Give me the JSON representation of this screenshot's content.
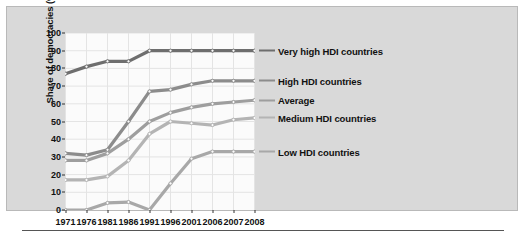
{
  "chart_data": {
    "type": "line",
    "title": "",
    "xlabel": "",
    "ylabel": "Share of democracies (%)",
    "categories": [
      "1971",
      "1976",
      "1981",
      "1986",
      "1991",
      "1996",
      "2001",
      "2006",
      "2007",
      "2008"
    ],
    "x": [
      1971,
      1976,
      1981,
      1986,
      1991,
      1996,
      2001,
      2006,
      2007,
      2008
    ],
    "ylim": [
      0,
      100
    ],
    "yticks": [
      0,
      10,
      20,
      30,
      40,
      50,
      60,
      70,
      80,
      90,
      100
    ],
    "grid": true,
    "legend_position": "right",
    "series": [
      {
        "name": "Very high HDI countries",
        "color": "#6e6e6e",
        "values": [
          77,
          81,
          84,
          84,
          90,
          90,
          90,
          90,
          90,
          90
        ]
      },
      {
        "name": "High HDI countries",
        "color": "#8c8c8c",
        "values": [
          32,
          31,
          34,
          50,
          67,
          68,
          71,
          73,
          73,
          73
        ]
      },
      {
        "name": "Average",
        "color": "#9e9e9e",
        "values": [
          28,
          28,
          32,
          40,
          50,
          55,
          58,
          60,
          61,
          62
        ]
      },
      {
        "name": "Medium HDI countries",
        "color": "#b4b4b4",
        "values": [
          17,
          17,
          19,
          28,
          43,
          50,
          49,
          48,
          51,
          52
        ]
      },
      {
        "name": "Low HDI countries",
        "color": "#a8a8a8",
        "values": [
          0,
          0,
          4,
          4.5,
          0,
          15,
          29,
          33,
          33,
          33
        ]
      }
    ]
  }
}
